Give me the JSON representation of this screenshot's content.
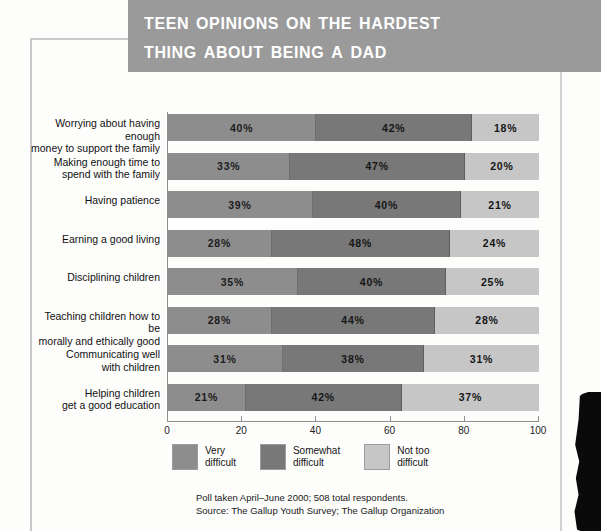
{
  "title": {
    "line1": "Teen Opinions on the Hardest",
    "line2": "Thing About Being a Dad"
  },
  "chart_data": {
    "type": "bar",
    "orientation": "horizontal",
    "stacked": true,
    "title": "Teen Opinions on the Hardest Thing About Being a Dad",
    "xlabel": "",
    "ylabel": "",
    "xlim": [
      0,
      100
    ],
    "grid": false,
    "legend_position": "bottom",
    "categories": [
      "Worrying about having enough\nmoney to support the family",
      "Making enough time to\nspend with the family",
      "Having patience",
      "Earning a good living",
      "Disciplining children",
      "Teaching children how to be\nmorally and ethically good",
      "Communicating well\nwith children",
      "Helping children\nget a good education"
    ],
    "xticks": [
      "0",
      "20",
      "40",
      "60",
      "80",
      "100"
    ],
    "series": [
      {
        "name": "Very\ndifficult",
        "legend_label": "Very\ndifficult",
        "color": "#8d8d8d",
        "values": [
          40,
          33,
          39,
          28,
          35,
          28,
          31,
          21
        ],
        "labels": [
          "40%",
          "33%",
          "39%",
          "28%",
          "35%",
          "28%",
          "31%",
          "21%"
        ]
      },
      {
        "name": "Somewhat\ndifficult",
        "legend_label": "Somewhat\ndifficult",
        "color": "#787878",
        "values": [
          42,
          47,
          40,
          48,
          40,
          44,
          38,
          42
        ],
        "labels": [
          "42%",
          "47%",
          "40%",
          "48%",
          "40%",
          "44%",
          "38%",
          "42%"
        ]
      },
      {
        "name": "Not too\ndifficult",
        "legend_label": "Not too\ndifficult",
        "color": "#c6c6c6",
        "values": [
          18,
          20,
          21,
          24,
          25,
          28,
          31,
          37
        ],
        "labels": [
          "18%",
          "20%",
          "21%",
          "24%",
          "25%",
          "28%",
          "31%",
          "37%"
        ]
      }
    ]
  },
  "footnote": {
    "line1": "Poll taken April–June 2000; 508 total respondents.",
    "line2": "Source: The Gallup Youth Survey; The Gallup Organization"
  }
}
